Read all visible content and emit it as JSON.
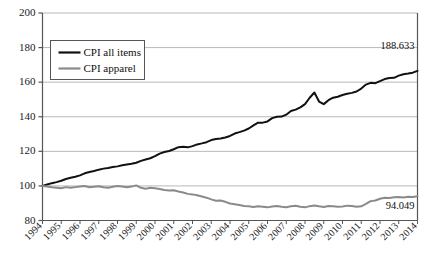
{
  "chart_data": {
    "type": "line",
    "title": "",
    "subtitle": "",
    "xlabel": "",
    "ylabel": "",
    "xlim": [
      1994,
      2014
    ],
    "ylim": [
      80,
      200
    ],
    "yticks": [
      80,
      100,
      120,
      140,
      160,
      180,
      200
    ],
    "ytick_labels": [
      "80",
      "100",
      "120",
      "140",
      "160",
      "180",
      "200"
    ],
    "xticks": [
      1994,
      1995,
      1996,
      1997,
      1998,
      1999,
      2000,
      2001,
      2002,
      2003,
      2004,
      2005,
      2006,
      2007,
      2008,
      2009,
      2010,
      2011,
      2012,
      2013,
      2014
    ],
    "xtick_labels": [
      "1994",
      "1995",
      "1996",
      "1997",
      "1998",
      "1999",
      "2000",
      "2001",
      "2002",
      "2003",
      "2004",
      "2005",
      "2006",
      "2007",
      "2008",
      "2009",
      "2010",
      "2011",
      "2012",
      "2013",
      "2014"
    ],
    "grid": "horizontal",
    "legend_position": "upper-left",
    "series": [
      {
        "name": "CPI all items",
        "color": "#111111",
        "width": 2.0,
        "end_label": "188.633",
        "end_value": 188.633,
        "x": [
          1994.0,
          1994.25,
          1994.5,
          1994.75,
          1995.0,
          1995.25,
          1995.5,
          1995.75,
          1996.0,
          1996.25,
          1996.5,
          1996.75,
          1997.0,
          1997.25,
          1997.5,
          1997.75,
          1998.0,
          1998.25,
          1998.5,
          1998.75,
          1999.0,
          1999.25,
          1999.5,
          1999.75,
          2000.0,
          2000.25,
          2000.5,
          2000.75,
          2001.0,
          2001.25,
          2001.5,
          2001.75,
          2002.0,
          2002.25,
          2002.5,
          2002.75,
          2003.0,
          2003.25,
          2003.5,
          2003.75,
          2004.0,
          2004.25,
          2004.5,
          2004.75,
          2005.0,
          2005.25,
          2005.5,
          2005.75,
          2006.0,
          2006.25,
          2006.5,
          2006.75,
          2007.0,
          2007.25,
          2007.5,
          2007.75,
          2008.0,
          2008.25,
          2008.5,
          2008.75,
          2009.0,
          2009.25,
          2009.5,
          2009.75,
          2010.0,
          2010.25,
          2010.5,
          2010.75,
          2011.0,
          2011.25,
          2011.5,
          2011.75,
          2012.0,
          2012.25,
          2012.5,
          2012.75,
          2013.0,
          2013.25,
          2013.5,
          2013.75,
          2014.0
        ],
        "values": [
          100.0,
          100.8,
          101.6,
          102.2,
          103.0,
          104.0,
          104.7,
          105.3,
          106.1,
          107.3,
          108.0,
          108.6,
          109.4,
          110.0,
          110.4,
          110.9,
          111.3,
          111.9,
          112.4,
          112.8,
          113.4,
          114.5,
          115.3,
          116.0,
          117.2,
          118.7,
          119.6,
          120.2,
          121.2,
          122.4,
          122.6,
          122.3,
          123.0,
          124.0,
          124.6,
          125.3,
          126.5,
          127.1,
          127.4,
          128.0,
          128.9,
          130.3,
          131.1,
          132.0,
          133.2,
          135.0,
          136.6,
          136.6,
          137.3,
          139.2,
          140.0,
          140.1,
          141.2,
          143.3,
          144.1,
          145.4,
          147.3,
          151.0,
          154.0,
          148.8,
          147.3,
          149.6,
          151.0,
          151.6,
          152.6,
          153.3,
          153.8,
          154.6,
          156.3,
          158.6,
          159.6,
          159.4,
          160.6,
          161.8,
          162.4,
          162.5,
          163.8,
          164.6,
          165.0,
          165.5,
          166.5
        ]
      },
      {
        "name": "CPI apparel",
        "color": "#8a8a8a",
        "width": 2.0,
        "end_label": "94.049",
        "end_value": 94.049,
        "x": [
          1994.0,
          1994.25,
          1994.5,
          1994.75,
          1995.0,
          1995.25,
          1995.5,
          1995.75,
          1996.0,
          1996.25,
          1996.5,
          1996.75,
          1997.0,
          1997.25,
          1997.5,
          1997.75,
          1998.0,
          1998.25,
          1998.5,
          1998.75,
          1999.0,
          1999.25,
          1999.5,
          1999.75,
          2000.0,
          2000.25,
          2000.5,
          2000.75,
          2001.0,
          2001.25,
          2001.5,
          2001.75,
          2002.0,
          2002.25,
          2002.5,
          2002.75,
          2003.0,
          2003.25,
          2003.5,
          2003.75,
          2004.0,
          2004.25,
          2004.5,
          2004.75,
          2005.0,
          2005.25,
          2005.5,
          2005.75,
          2006.0,
          2006.25,
          2006.5,
          2006.75,
          2007.0,
          2007.25,
          2007.5,
          2007.75,
          2008.0,
          2008.25,
          2008.5,
          2008.75,
          2009.0,
          2009.25,
          2009.5,
          2009.75,
          2010.0,
          2010.25,
          2010.5,
          2010.75,
          2011.0,
          2011.25,
          2011.5,
          2011.75,
          2012.0,
          2012.25,
          2012.5,
          2012.75,
          2013.0,
          2013.25,
          2013.5,
          2013.75,
          2014.0
        ],
        "values": [
          100.0,
          99.6,
          99.2,
          99.0,
          98.6,
          99.3,
          98.9,
          99.3,
          99.6,
          99.9,
          99.2,
          99.5,
          99.8,
          99.2,
          98.9,
          99.5,
          100.0,
          99.6,
          99.2,
          99.6,
          100.3,
          98.9,
          98.4,
          98.9,
          98.6,
          98.2,
          97.6,
          97.3,
          97.5,
          96.8,
          96.2,
          95.4,
          95.1,
          94.6,
          93.9,
          93.2,
          92.2,
          91.4,
          91.6,
          90.8,
          89.8,
          89.4,
          89.0,
          88.4,
          88.2,
          87.8,
          88.3,
          88.0,
          87.6,
          88.1,
          88.4,
          88.0,
          87.7,
          88.2,
          88.5,
          88.0,
          87.6,
          88.3,
          88.7,
          88.2,
          87.8,
          88.4,
          88.2,
          87.9,
          88.1,
          88.6,
          88.4,
          88.0,
          88.2,
          89.6,
          91.2,
          91.6,
          92.6,
          93.1,
          93.0,
          93.4,
          93.6,
          93.3,
          93.7,
          93.6,
          94.049
        ]
      }
    ]
  },
  "legend": {
    "items": [
      {
        "label": "CPI all items",
        "color": "#111111"
      },
      {
        "label": "CPI apparel",
        "color": "#8a8a8a"
      }
    ]
  },
  "annotations": [
    {
      "name": "cpi-all-items-end-value",
      "text": "188.633"
    },
    {
      "name": "cpi-apparel-end-value",
      "text": "94.049"
    }
  ]
}
